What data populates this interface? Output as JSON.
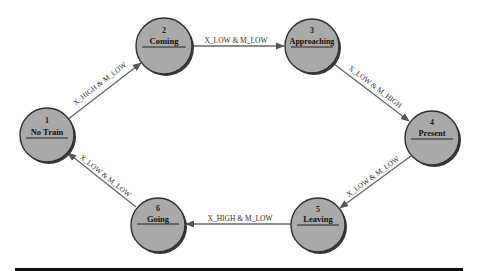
{
  "diagram": {
    "type": "state-machine",
    "nodes": [
      {
        "id": "1",
        "number": "1",
        "name": "No Train",
        "cx": 47,
        "cy": 135,
        "r": 27
      },
      {
        "id": "2",
        "number": "2",
        "name": "Coming",
        "cx": 164,
        "cy": 46,
        "r": 28
      },
      {
        "id": "3",
        "number": "3",
        "name": "Approaching",
        "cx": 312,
        "cy": 46,
        "r": 27
      },
      {
        "id": "4",
        "number": "4",
        "name": "Present",
        "cx": 432,
        "cy": 138,
        "r": 27
      },
      {
        "id": "5",
        "number": "5",
        "name": "Leaving",
        "cx": 318,
        "cy": 225,
        "r": 27
      },
      {
        "id": "6",
        "number": "6",
        "name": "Going",
        "cx": 158,
        "cy": 225,
        "r": 27
      }
    ],
    "edges": [
      {
        "from": "1",
        "to": "2",
        "label": "X_HIGH & M_LOW"
      },
      {
        "from": "2",
        "to": "3",
        "label": "X_LOW & M_LOW"
      },
      {
        "from": "3",
        "to": "4",
        "label": "X_LOW & M_HIGH"
      },
      {
        "from": "4",
        "to": "5",
        "label": "X_LOW & M_LOW"
      },
      {
        "from": "5",
        "to": "6",
        "label": "X_HIGH & M_LOW"
      },
      {
        "from": "6",
        "to": "1",
        "label": "X_LOW & M_LOW"
      }
    ],
    "colors": {
      "node_fill": "#a9a9a9",
      "node_stroke": "#303030",
      "edge": "#666666",
      "rule": "#111111"
    }
  }
}
